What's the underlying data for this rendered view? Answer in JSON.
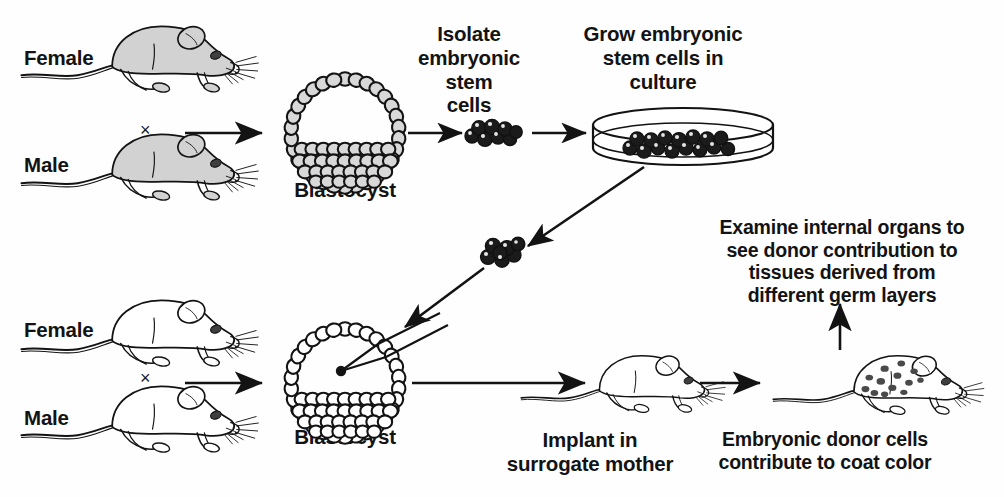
{
  "figure": {
    "type": "biology-process-diagram"
  },
  "labels": {
    "top_female": "Female",
    "top_male": "Male",
    "top_cross": "×",
    "top_blastocyst": "Blastocyst",
    "isolate_es_cells": "Isolate\nembryonic\nstem\ncells",
    "grow_es_cells": "Grow embryonic\nstem cells in\nculture",
    "bottom_female": "Female",
    "bottom_male": "Male",
    "bottom_cross": "×",
    "bottom_blastocyst": "Blastocyst",
    "implant_surrogate": "Implant in\nsurrogate mother",
    "examine_organs": "Examine internal organs to\nsee donor contribution to\ntissues derived from\ndifferent germ layers",
    "coat_color": "Embryonic donor cells\ncontribute to coat color"
  },
  "elements": {
    "mouse_agouti_female": "agouti-mouse",
    "mouse_agouti_male": "agouti-mouse",
    "mouse_albino_female": "albino-mouse",
    "mouse_albino_male": "albino-mouse",
    "mouse_surrogate": "albino-surrogate-mouse",
    "mouse_chimeric": "chimeric-spotted-mouse",
    "blastocyst_donor": "blastocyst-with-inner-cell-mass",
    "blastocyst_host": "blastocyst-injected",
    "es_cell_clump_isolated": "es-cell-clump",
    "es_cell_clump_injected": "es-cell-clump",
    "petri_dish": "petri-dish-with-es-cells",
    "micropipette": "injection-micropipette",
    "injected_cell_dot": "injected-cell"
  },
  "colors": {
    "ink": "#131313",
    "mouse_fill_agouti": "#d2d2d2",
    "mouse_fill_albino": "#ffffff",
    "blastocyst_cell_fill_donor": "#d8d8d8",
    "blastocyst_cell_fill_host": "#ffffff",
    "es_cell_fill": "#1b1b1b",
    "background": "#fefefe"
  },
  "arrows": [
    {
      "name": "arrow-top-cross-to-blastocyst",
      "direction": "right"
    },
    {
      "name": "arrow-blastocyst-to-es-cells",
      "direction": "right"
    },
    {
      "name": "arrow-es-cells-to-culture",
      "direction": "right"
    },
    {
      "name": "arrow-culture-to-clump",
      "direction": "down-left"
    },
    {
      "name": "arrow-clump-to-host-blastocyst",
      "direction": "down-left"
    },
    {
      "name": "arrow-bottom-cross-to-blastocyst",
      "direction": "right"
    },
    {
      "name": "arrow-blastocyst-to-surrogate",
      "direction": "right"
    },
    {
      "name": "arrow-surrogate-to-chimera",
      "direction": "right"
    },
    {
      "name": "arrow-chimera-to-examine",
      "direction": "up"
    }
  ]
}
